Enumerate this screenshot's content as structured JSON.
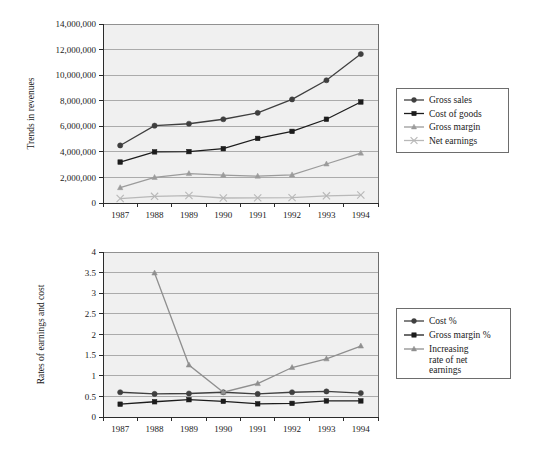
{
  "figure": {
    "background_color": "#ffffff",
    "plot_background_color": "#f0f0f0",
    "gridline_color": "#9a9a9a",
    "axis_color": "#2b2b2b"
  },
  "colors": {
    "gross_sales": "#3f3f3f",
    "cost_of_goods": "#1c1c1c",
    "gross_margin": "#9b9b9b",
    "net_earnings": "#b8b8b8",
    "cost_pct": "#3f3f3f",
    "gross_margin_pct": "#1c1c1c",
    "increasing_rate": "#8f8f8f"
  },
  "chart_data": [
    {
      "id": "trends-in-revenues",
      "type": "line",
      "title": "",
      "xlabel": "",
      "ylabel": "Trends in revenues",
      "categories": [
        "1987",
        "1988",
        "1989",
        "1990",
        "1991",
        "1992",
        "1993",
        "1994"
      ],
      "ylim": [
        0,
        14000000
      ],
      "yticks": [
        0,
        2000000,
        4000000,
        6000000,
        8000000,
        10000000,
        12000000,
        14000000
      ],
      "ytick_labels": [
        "0",
        "2,000,000",
        "4,000,000",
        "6,000,000",
        "8,000,000",
        "10,000,000",
        "12,000,000",
        "14,000,000"
      ],
      "grid": true,
      "legend_position": "right",
      "series": [
        {
          "name": "Gross sales",
          "marker": "circle",
          "color_key": "gross_sales",
          "values": [
            4500000,
            6050000,
            6200000,
            6550000,
            7050000,
            8100000,
            9600000,
            11650000
          ]
        },
        {
          "name": "Cost of goods",
          "marker": "square",
          "color_key": "cost_of_goods",
          "values": [
            3200000,
            4000000,
            4020000,
            4250000,
            5050000,
            5600000,
            6550000,
            7900000
          ]
        },
        {
          "name": "Gross margin",
          "marker": "triangle",
          "color_key": "gross_margin",
          "values": [
            1200000,
            2000000,
            2300000,
            2180000,
            2100000,
            2200000,
            3050000,
            3900000
          ]
        },
        {
          "name": "Net earnings",
          "marker": "cross",
          "color_key": "net_earnings",
          "values": [
            350000,
            520000,
            580000,
            390000,
            400000,
            420000,
            560000,
            620000
          ]
        }
      ]
    },
    {
      "id": "rates-of-earnings-and-cost",
      "type": "line",
      "title": "",
      "xlabel": "",
      "ylabel": "Rates of earnings and cost",
      "categories": [
        "1987",
        "1988",
        "1989",
        "1990",
        "1991",
        "1992",
        "1993",
        "1994"
      ],
      "ylim": [
        0,
        4
      ],
      "yticks": [
        0,
        0.5,
        1,
        1.5,
        2,
        2.5,
        3,
        3.5,
        4
      ],
      "ytick_labels": [
        "0",
        "0.5",
        "1",
        "1.5",
        "2",
        "2.5",
        "3",
        "3.5",
        "4"
      ],
      "grid": true,
      "legend_position": "right",
      "series": [
        {
          "name": "Cost %",
          "marker": "circle",
          "color_key": "cost_pct",
          "values": [
            0.6,
            0.56,
            0.57,
            0.6,
            0.56,
            0.6,
            0.62,
            0.58
          ]
        },
        {
          "name": "Gross margin %",
          "marker": "square",
          "color_key": "gross_margin_pct",
          "values": [
            0.31,
            0.37,
            0.42,
            0.38,
            0.32,
            0.33,
            0.39,
            0.39
          ]
        },
        {
          "name": "Increasing rate of net earnings",
          "name_lines": [
            "Increasing",
            "rate of net",
            "earnings"
          ],
          "marker": "triangle",
          "color_key": "increasing_rate",
          "values": [
            null,
            3.49,
            1.26,
            0.6,
            0.81,
            1.2,
            1.41,
            1.72
          ]
        }
      ]
    }
  ]
}
